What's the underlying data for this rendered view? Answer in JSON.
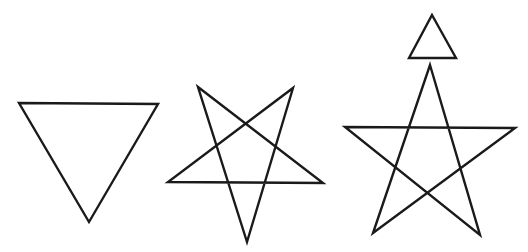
{
  "canvas": {
    "width": 528,
    "height": 252,
    "background_color": "#ffffff",
    "stroke_color": "#1a1a1a",
    "description": "Line-drawing of three geometric figures left to right"
  },
  "figures": [
    {
      "id": "figure-1",
      "name": "downward-triangle",
      "label": "Inverted triangle",
      "stroke_width": 2.4,
      "parts": [
        {
          "name": "triangle-outline",
          "type": "polygon",
          "points": "19,103 158,104 89,222"
        }
      ]
    },
    {
      "id": "figure-2",
      "name": "inverted-pentagram",
      "label": "Five-pointed star, point down",
      "stroke_width": 2.4,
      "parts": [
        {
          "name": "pentagram-outline",
          "type": "polygon",
          "points": "198,87 323,183 168,182 293,88 247,242"
        }
      ]
    },
    {
      "id": "figure-3",
      "name": "upright-pentagram-with-triangle",
      "label": "Five-pointed star, point up, with small triangle above",
      "stroke_width": 2.4,
      "parts": [
        {
          "name": "small-triangle-outline",
          "type": "polygon",
          "points": "432,15 456,58 409,58"
        },
        {
          "name": "pentagram-outline",
          "type": "polygon",
          "points": "430,65 480,235 345,127 515,128 373,233"
        }
      ]
    }
  ]
}
